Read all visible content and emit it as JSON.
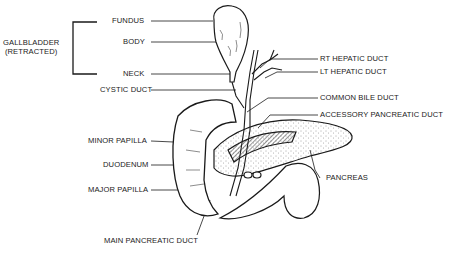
{
  "figure": {
    "group_label": {
      "line1": "GALLBLADDER",
      "line2": "(RETRACTED)"
    },
    "labels": {
      "fundus": "FUNDUS",
      "body": "BODY",
      "neck": "NECK",
      "cystic_duct": "CYSTIC DUCT",
      "rt_hepatic_duct": "RT HEPATIC DUCT",
      "lt_hepatic_duct": "LT HEPATIC DUCT",
      "common_bile_duct": "COMMON BILE DUCT",
      "accessory_pancreatic_duct": "ACCESSORY PANCREATIC DUCT",
      "minor_papilla": "MINOR PAPILLA",
      "duodenum": "DUODENUM",
      "major_papilla": "MAJOR PAPILLA",
      "pancreas": "PANCREAS",
      "main_pancreatic_duct": "MAIN PANCREATIC DUCT"
    },
    "colors": {
      "ink": "#1a1a1a",
      "background": "#ffffff"
    }
  }
}
